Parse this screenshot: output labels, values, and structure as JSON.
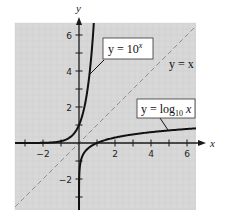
{
  "chart_data": {
    "type": "line",
    "title": "",
    "xlabel": "x",
    "ylabel": "y",
    "xlim": [
      -3.55,
      6.5
    ],
    "ylim": [
      -3.7,
      6.65
    ],
    "grid": true,
    "x_ticks": [
      -3,
      -2,
      -1,
      1,
      2,
      3,
      4,
      5,
      6
    ],
    "x_tick_labels": [
      {
        "value": -2,
        "label": "−2"
      },
      {
        "value": 2,
        "label": "2"
      },
      {
        "value": 4,
        "label": "4"
      },
      {
        "value": 6,
        "label": "6"
      }
    ],
    "y_ticks": [
      -3,
      -2,
      -1,
      1,
      2,
      3,
      4,
      5,
      6
    ],
    "y_tick_labels": [
      {
        "value": -2,
        "label": "−2"
      },
      {
        "value": 2,
        "label": "2"
      },
      {
        "value": 4,
        "label": "4"
      },
      {
        "value": 6,
        "label": "6"
      }
    ],
    "series": [
      {
        "name": "y = 10^x",
        "function": "10^x",
        "style": "solid",
        "points": [
          [
            -3.5,
            0.0003
          ],
          [
            -2,
            0.01
          ],
          [
            -1,
            0.1
          ],
          [
            0,
            1
          ],
          [
            0.3,
            2
          ],
          [
            0.5,
            3.16
          ],
          [
            0.6,
            3.98
          ],
          [
            0.7,
            5.01
          ],
          [
            0.8,
            6.31
          ]
        ]
      },
      {
        "name": "y = log10 x",
        "function": "log10(x)",
        "style": "solid",
        "points": [
          [
            0.0003,
            -3.5
          ],
          [
            0.01,
            -2
          ],
          [
            0.1,
            -1
          ],
          [
            1,
            0
          ],
          [
            2,
            0.3
          ],
          [
            3,
            0.48
          ],
          [
            4,
            0.6
          ],
          [
            5,
            0.7
          ],
          [
            6,
            0.78
          ],
          [
            6.5,
            0.81
          ]
        ]
      },
      {
        "name": "y = x",
        "function": "x",
        "style": "dashed",
        "points": [
          [
            -3.55,
            -3.55
          ],
          [
            6.5,
            6.5
          ]
        ]
      }
    ],
    "annotations": [
      {
        "text_main": "y = 10",
        "superscript": "x",
        "series": "y = 10^x",
        "boxed": true
      },
      {
        "text_main": "y = x",
        "series": "y = x",
        "boxed": false
      },
      {
        "text_main": "y = log",
        "subscript": "10",
        "text_tail": " x",
        "series": "y = log10 x",
        "boxed": true
      }
    ]
  },
  "labels": {
    "x_axis": "x",
    "y_axis": "y",
    "exp_main": "y = 10",
    "exp_sup": "x",
    "identity": "y = x",
    "log_main": "y = log",
    "log_sub": "10",
    "log_tail": " x"
  },
  "colors": {
    "plot_bg": "#d8d8d8",
    "grid": "#cdcdcd",
    "curve": "#111111",
    "dashed": "#8e8e8e",
    "axis": "#1a1a1a"
  }
}
